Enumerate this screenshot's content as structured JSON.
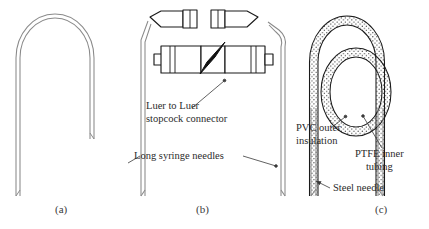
{
  "figure": {
    "background_color": "#ffffff",
    "needle_color": "#8a8a8a",
    "outline_color": "#1a1a1a",
    "lever_color": "#111111",
    "text_color": "#2b2b2b"
  },
  "panels": [
    {
      "id": "a",
      "caption": "(a)",
      "caption_x": 55,
      "caption_y": 203
    },
    {
      "id": "b",
      "caption": "(b)",
      "caption_x": 196,
      "caption_y": 203
    },
    {
      "id": "c",
      "caption": "(c)",
      "caption_x": 375,
      "caption_y": 203
    }
  ],
  "labels": {
    "stopcock_line1": "Luer to Luer",
    "stopcock_line2": "stopcock connector",
    "needles": "Long syringe needles",
    "pvc_line1": "PVC outer",
    "pvc_line2": "insulation",
    "ptfe_line1": "PTFE inner",
    "ptfe_line2": "tubing",
    "steel": "Steel needle"
  },
  "components": {
    "luer_fitting_left": "luer-fitting-male",
    "luer_fitting_right": "luer-fitting-female",
    "stopcock_body": "stopcock-connector-body",
    "stopcock_lever": "stopcock-lever-handle",
    "needle_arch_a": "needle-arch-plain",
    "needle_arch_b": "needle-arch-split",
    "insulated_loop": "insulated-crossing-loop"
  }
}
